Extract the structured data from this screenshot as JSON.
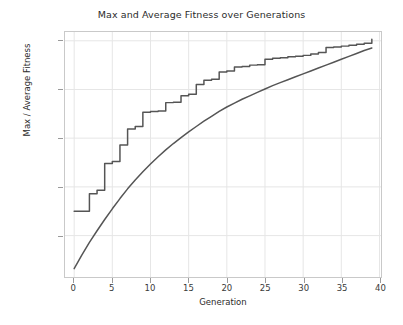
{
  "chart_data": {
    "type": "line",
    "title": "Max and Average Fitness over Generations",
    "xlabel": "Generation",
    "ylabel": "Max / Average Fitness",
    "xlim": [
      -1.2,
      40.2
    ],
    "ylim": [
      51.5,
      101.8
    ],
    "xticks": [
      0,
      5,
      10,
      15,
      20,
      25,
      30,
      35,
      40
    ],
    "yticks": [
      60,
      70,
      80,
      90,
      100
    ],
    "grid": true,
    "legend": "none",
    "line_color": "#555555",
    "grid_color": "#e6e6e6",
    "frame_color": "#c9c9c9",
    "background": "#ffffff",
    "x": [
      0,
      1,
      2,
      3,
      4,
      5,
      6,
      7,
      8,
      9,
      10,
      11,
      12,
      13,
      14,
      15,
      16,
      17,
      18,
      19,
      20,
      21,
      22,
      23,
      24,
      25,
      26,
      27,
      28,
      29,
      30,
      31,
      32,
      33,
      34,
      35,
      36,
      37,
      38,
      39
    ],
    "series": [
      {
        "name": "Max Fitness",
        "drawstyle": "steps-post",
        "values": [
          65.0,
          65.0,
          68.6,
          69.3,
          74.8,
          75.2,
          78.6,
          81.9,
          82.4,
          85.3,
          85.5,
          85.6,
          87.3,
          87.4,
          88.7,
          89.0,
          91.0,
          91.9,
          92.1,
          93.6,
          93.8,
          94.6,
          94.7,
          95.0,
          95.1,
          96.2,
          96.4,
          96.5,
          96.7,
          96.8,
          97.0,
          97.3,
          97.6,
          98.6,
          98.7,
          98.9,
          99.1,
          99.3,
          99.5,
          100.3
        ]
      },
      {
        "name": "Average Fitness",
        "drawstyle": "default",
        "values": [
          53.2,
          56.0,
          58.6,
          61.0,
          63.3,
          65.5,
          67.6,
          69.6,
          71.4,
          73.1,
          74.7,
          76.2,
          77.6,
          78.9,
          80.1,
          81.3,
          82.4,
          83.5,
          84.5,
          85.5,
          86.4,
          87.2,
          88.0,
          88.7,
          89.4,
          90.1,
          90.8,
          91.4,
          92.0,
          92.6,
          93.2,
          93.8,
          94.4,
          95.0,
          95.6,
          96.2,
          96.8,
          97.4,
          98.0,
          98.5
        ]
      }
    ]
  }
}
